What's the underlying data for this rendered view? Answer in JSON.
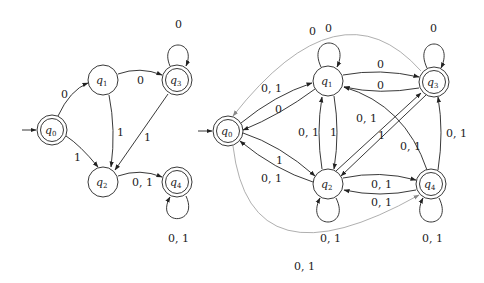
{
  "diagrams": [
    {
      "name": "left-dfa",
      "states": [
        {
          "id": "q0",
          "label": "q",
          "sub": "0",
          "accepting": true,
          "initial": true
        },
        {
          "id": "q1",
          "label": "q",
          "sub": "1",
          "accepting": false
        },
        {
          "id": "q2",
          "label": "q",
          "sub": "2",
          "accepting": false
        },
        {
          "id": "q3",
          "label": "q",
          "sub": "3",
          "accepting": true
        },
        {
          "id": "q4",
          "label": "q",
          "sub": "4",
          "accepting": true
        }
      ],
      "transitions": [
        {
          "from": "q0",
          "to": "q1",
          "label": "0"
        },
        {
          "from": "q0",
          "to": "q2",
          "label": "1"
        },
        {
          "from": "q1",
          "to": "q3",
          "label": "0"
        },
        {
          "from": "q1",
          "to": "q2",
          "label": "1"
        },
        {
          "from": "q3",
          "to": "q3",
          "label": "0"
        },
        {
          "from": "q3",
          "to": "q2",
          "label": "1"
        },
        {
          "from": "q2",
          "to": "q4",
          "label": "0, 1"
        },
        {
          "from": "q4",
          "to": "q4",
          "label": "0, 1"
        }
      ]
    },
    {
      "name": "right-nfa",
      "states": [
        {
          "id": "q0",
          "label": "q",
          "sub": "0",
          "accepting": true,
          "initial": true
        },
        {
          "id": "q1",
          "label": "q",
          "sub": "1",
          "accepting": false
        },
        {
          "id": "q2",
          "label": "q",
          "sub": "2",
          "accepting": false
        },
        {
          "id": "q3",
          "label": "q",
          "sub": "3",
          "accepting": true
        },
        {
          "id": "q4",
          "label": "q",
          "sub": "4",
          "accepting": true
        }
      ],
      "transitions": [
        {
          "from": "q0",
          "to": "q1",
          "label": "0, 1"
        },
        {
          "from": "q1",
          "to": "q0",
          "label": "0"
        },
        {
          "from": "q0",
          "to": "q2",
          "label": "1"
        },
        {
          "from": "q2",
          "to": "q0",
          "label": "0, 1"
        },
        {
          "from": "q1",
          "to": "q1",
          "label": "0"
        },
        {
          "from": "q1",
          "to": "q3",
          "label": "0"
        },
        {
          "from": "q3",
          "to": "q1",
          "label": "0"
        },
        {
          "from": "q2",
          "to": "q1",
          "label": "0, 1"
        },
        {
          "from": "q1",
          "to": "q2",
          "label": "1"
        },
        {
          "from": "q2",
          "to": "q3",
          "label": "0, 1"
        },
        {
          "from": "q3",
          "to": "q2",
          "label": "1"
        },
        {
          "from": "q3",
          "to": "q3",
          "label": "0"
        },
        {
          "from": "q4",
          "to": "q1",
          "label": "0, 1"
        },
        {
          "from": "q4",
          "to": "q3",
          "label": "0, 1"
        },
        {
          "from": "q2",
          "to": "q4",
          "label": "0, 1"
        },
        {
          "from": "q4",
          "to": "q2",
          "label": "0, 1"
        },
        {
          "from": "q2",
          "to": "q2",
          "label": "0, 1"
        },
        {
          "from": "q4",
          "to": "q4",
          "label": "0, 1"
        },
        {
          "from": "q3",
          "to": "q0",
          "label": "0",
          "style": "faint"
        },
        {
          "from": "q0",
          "to": "q4",
          "label": "0, 1",
          "style": "faint"
        }
      ]
    }
  ],
  "labels": {
    "l_q0q1": "0",
    "l_q0q2": "1",
    "l_q1q3": "0",
    "l_q1q2": "1",
    "l_q3loop": "0",
    "l_q3q2": "1",
    "l_q2q4": "0, 1",
    "l_q4loop": "0, 1",
    "r_q0q1": "0, 1",
    "r_q1q0": "0",
    "r_q0q2": "1",
    "r_q2q0": "0, 1",
    "r_q1loop": "0",
    "r_q3q0": "0",
    "r_q1q3": "0",
    "r_q3q1": "0",
    "r_q2q1": "0, 1",
    "r_q1q2": "1",
    "r_q2q3": "0, 1",
    "r_q3q2": "1",
    "r_q3loop": "0",
    "r_q4q1": "0, 1",
    "r_q4q3": "0, 1",
    "r_q2q4": "0, 1",
    "r_q4q2": "0, 1",
    "r_q2loop": "0, 1",
    "r_q4loop": "0, 1",
    "r_q0q4": "0, 1"
  },
  "state_text": {
    "q": "q",
    "s0": "0",
    "s1": "1",
    "s2": "2",
    "s3": "3",
    "s4": "4"
  }
}
